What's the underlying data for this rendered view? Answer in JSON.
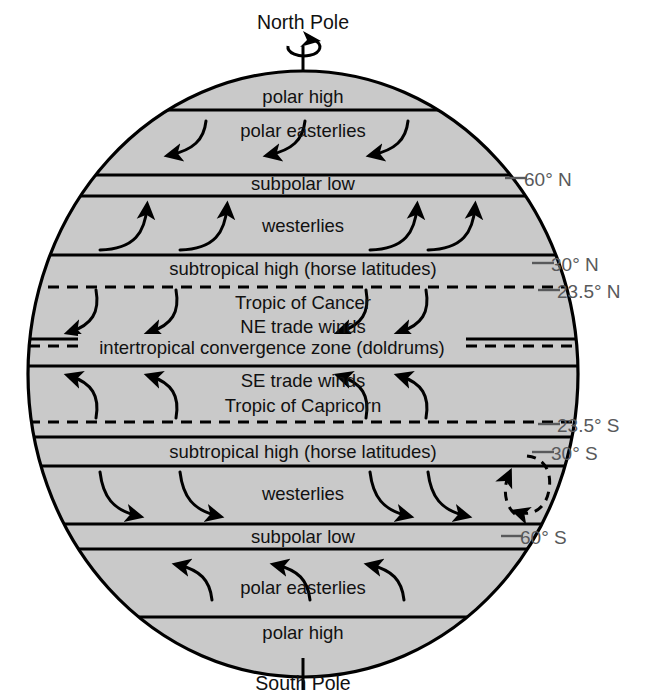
{
  "figure": {
    "type": "diagram",
    "colors": {
      "globe_fill": "#c9c9c9",
      "outline": "#000000",
      "text": "#111111",
      "latitude_label": "#58595b",
      "background": "#ffffff"
    }
  },
  "poles": {
    "north": "North Pole",
    "south": "South Pole",
    "rotation_icon": "rotation-arrow-icon"
  },
  "bands": [
    {
      "id": "polar-high-n",
      "label": "polar high",
      "hemisphere": "N"
    },
    {
      "id": "polar-easterlies-n",
      "label": "polar easterlies",
      "hemisphere": "N"
    },
    {
      "id": "subpolar-low-n",
      "label": "subpolar low",
      "hemisphere": "N"
    },
    {
      "id": "westerlies-n",
      "label": "westerlies",
      "hemisphere": "N"
    },
    {
      "id": "subtropical-high-n",
      "label": "subtropical high (horse latitudes)",
      "hemisphere": "N"
    },
    {
      "id": "tropic-of-cancer",
      "label": "Tropic of Cancer",
      "hemisphere": "N"
    },
    {
      "id": "ne-trade-winds",
      "label": "NE trade winds",
      "hemisphere": "N"
    },
    {
      "id": "itcz",
      "label": "intertropical convergence zone (doldrums)",
      "hemisphere": "EQ"
    },
    {
      "id": "se-trade-winds",
      "label": "SE trade winds",
      "hemisphere": "S"
    },
    {
      "id": "tropic-of-capricorn",
      "label": "Tropic of Capricorn",
      "hemisphere": "S"
    },
    {
      "id": "subtropical-high-s",
      "label": "subtropical high (horse latitudes)",
      "hemisphere": "S"
    },
    {
      "id": "westerlies-s",
      "label": "westerlies",
      "hemisphere": "S"
    },
    {
      "id": "subpolar-low-s",
      "label": "subpolar low",
      "hemisphere": "S"
    },
    {
      "id": "polar-easterlies-s",
      "label": "polar easterlies",
      "hemisphere": "S"
    },
    {
      "id": "polar-high-s",
      "label": "polar high",
      "hemisphere": "S"
    }
  ],
  "latitude_labels": [
    {
      "id": "lat-60n",
      "text": "60° N"
    },
    {
      "id": "lat-30n",
      "text": "30° N"
    },
    {
      "id": "lat-235n",
      "text": "23.5° N"
    },
    {
      "id": "lat-235s",
      "text": "23.5° S"
    },
    {
      "id": "lat-30s",
      "text": "30° S"
    },
    {
      "id": "lat-60s",
      "text": "60° S"
    }
  ]
}
